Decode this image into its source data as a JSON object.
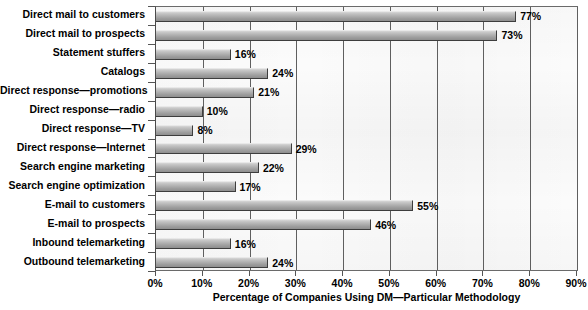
{
  "chart_data": {
    "type": "bar",
    "orientation": "horizontal",
    "title": "",
    "xlabel": "Percentage of Companies Using DM—Particular Methodology",
    "ylabel": "",
    "xlim": [
      0,
      90
    ],
    "xticks": [
      "0%",
      "10%",
      "20%",
      "30%",
      "40%",
      "50%",
      "60%",
      "70%",
      "80%",
      "90%"
    ],
    "xtick_values": [
      0,
      10,
      20,
      30,
      40,
      50,
      60,
      70,
      80,
      90
    ],
    "grid": true,
    "grid_axis": "x",
    "legend": false,
    "bar_color": "#b0b0b0",
    "categories": [
      "Direct mail to customers",
      "Direct mail to prospects",
      "Statement stuffers",
      "Catalogs",
      "Direct response—promotions",
      "Direct response—radio",
      "Direct response—TV",
      "Direct response—Internet",
      "Search engine marketing",
      "Search engine optimization",
      "E-mail to customers",
      "E-mail to prospects",
      "Inbound telemarketing",
      "Outbound telemarketing"
    ],
    "values": [
      77,
      73,
      16,
      24,
      21,
      10,
      8,
      29,
      22,
      17,
      55,
      46,
      16,
      24
    ],
    "value_labels": [
      "77%",
      "73%",
      "16%",
      "24%",
      "21%",
      "10%",
      "8%",
      "29%",
      "22%",
      "17%",
      "55%",
      "46%",
      "16%",
      "24%"
    ]
  }
}
